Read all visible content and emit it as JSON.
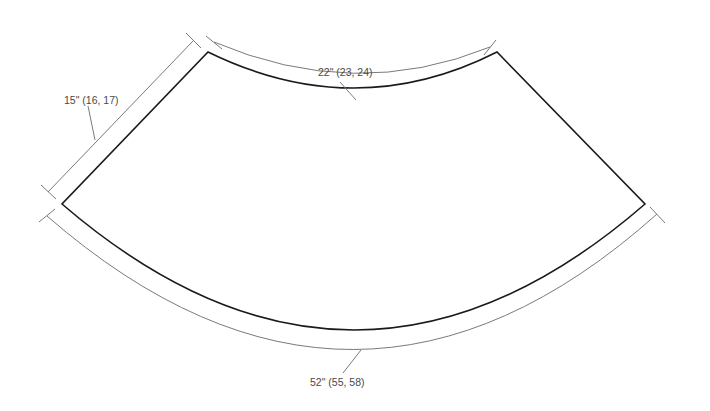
{
  "diagram": {
    "type": "sewing-pattern-piece",
    "shape": "annular-sector",
    "colors": {
      "outline": "#1a1a1a",
      "dimension": "#7a7a7a",
      "label": "#4a4a4a",
      "background": "#ffffff"
    },
    "dimensions": {
      "top_arc": {
        "label": "22\" (23, 24)"
      },
      "side_edge": {
        "label": "15\" (16, 17)"
      },
      "bottom_arc": {
        "label": "52\" (55, 58)"
      }
    }
  }
}
